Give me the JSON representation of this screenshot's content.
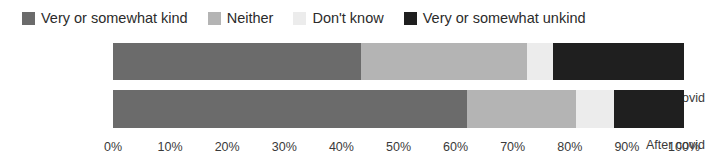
{
  "chart_data": {
    "type": "bar",
    "orientation": "horizontal",
    "stacked": true,
    "normalized_percent": true,
    "title": "",
    "xlabel": "",
    "ylabel": "",
    "xlim": [
      0,
      100
    ],
    "grid": false,
    "legend_position": "top-left",
    "categories": [
      "Before covid",
      "After covid"
    ],
    "tick_labels": [
      "0%",
      "10%",
      "20%",
      "30%",
      "40%",
      "50%",
      "60%",
      "70%",
      "80%",
      "90%",
      "100%"
    ],
    "tick_values": [
      0,
      10,
      20,
      30,
      40,
      50,
      60,
      70,
      80,
      90,
      100
    ],
    "series": [
      {
        "name": "Very or somewhat kind",
        "color": "#6b6b6b",
        "values": [
          43.4,
          62.0
        ]
      },
      {
        "name": "Neither",
        "color": "#b4b4b4",
        "values": [
          29.1,
          19.0
        ]
      },
      {
        "name": "Don't know",
        "color": "#ececec",
        "values": [
          4.5,
          6.8
        ]
      },
      {
        "name": "Very or somewhat unkind",
        "color": "#1f1f1f",
        "values": [
          23.0,
          12.2
        ]
      }
    ]
  },
  "legend": {
    "items": [
      {
        "label": "Very or somewhat kind",
        "color": "#6b6b6b"
      },
      {
        "label": "Neither",
        "color": "#b4b4b4"
      },
      {
        "label": "Don't know",
        "color": "#ececec"
      },
      {
        "label": "Very or somewhat unkind",
        "color": "#1f1f1f"
      }
    ]
  }
}
